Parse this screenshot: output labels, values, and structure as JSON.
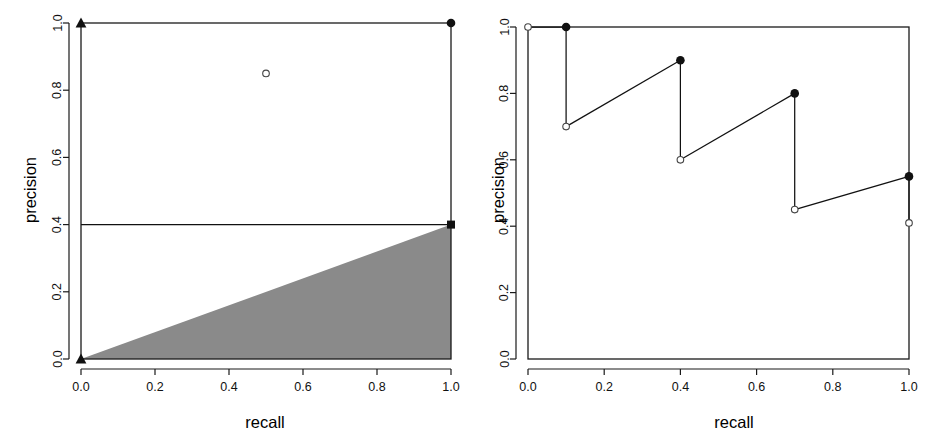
{
  "figure": {
    "background": "#ffffff",
    "ink_color": "#111111",
    "panel_count": 2
  },
  "chart_data": [
    {
      "panel": "left",
      "type": "scatter",
      "title": "",
      "xlabel": "recall",
      "ylabel": "precision",
      "xlim": [
        0.0,
        1.0
      ],
      "ylim": [
        0.0,
        1.0
      ],
      "xticks": [
        "0.0",
        "0.2",
        "0.4",
        "0.6",
        "0.8",
        "1.0"
      ],
      "xtickvalues": [
        0.0,
        0.2,
        0.4,
        0.6,
        0.8,
        1.0
      ],
      "yticks": [
        "0.0",
        "0.2",
        "0.4",
        "0.6",
        "0.8",
        "1.0"
      ],
      "ytickvalues": [
        0.0,
        0.2,
        0.4,
        0.6,
        0.8,
        1.0
      ],
      "grid": false,
      "legend": "none",
      "series": [
        {
          "name": "corner-markers-triangle",
          "marker": "filled-triangle",
          "points": [
            {
              "x": 0.0,
              "y": 1.0
            },
            {
              "x": 0.0,
              "y": 0.0
            }
          ]
        },
        {
          "name": "corner-marker-circle",
          "marker": "filled-circle",
          "points": [
            {
              "x": 1.0,
              "y": 1.0
            }
          ]
        },
        {
          "name": "interior-point",
          "marker": "open-circle",
          "points": [
            {
              "x": 0.5,
              "y": 0.85
            }
          ]
        },
        {
          "name": "baseline-endpoint",
          "marker": "filled-square",
          "points": [
            {
              "x": 1.0,
              "y": 0.4
            }
          ]
        }
      ],
      "lines": [
        {
          "name": "baseline-precision",
          "style": "solid",
          "points": [
            {
              "x": 0.0,
              "y": 0.4
            },
            {
              "x": 1.0,
              "y": 0.4
            }
          ]
        }
      ],
      "regions": [
        {
          "name": "achievable-region-triangle",
          "fill": "#8a8a8a",
          "vertices": [
            {
              "x": 0.0,
              "y": 0.0
            },
            {
              "x": 1.0,
              "y": 0.4
            },
            {
              "x": 1.0,
              "y": 0.0
            }
          ]
        }
      ]
    },
    {
      "panel": "right",
      "type": "line",
      "title": "",
      "xlabel": "recall",
      "ylabel": "precision",
      "xlim": [
        0.0,
        1.0
      ],
      "ylim": [
        0.0,
        1.0
      ],
      "xticks": [
        "0.0",
        "0.2",
        "0.4",
        "0.6",
        "0.8",
        "1.0"
      ],
      "xtickvalues": [
        0.0,
        0.2,
        0.4,
        0.6,
        0.8,
        1.0
      ],
      "yticks": [
        "0.0",
        "0.2",
        "0.4",
        "0.6",
        "0.8",
        "1.0"
      ],
      "ytickvalues": [
        0.0,
        0.2,
        0.4,
        0.6,
        0.8,
        1.0
      ],
      "grid": false,
      "legend": "none",
      "staircase": {
        "name": "precision-recall-sawtooth",
        "segments": [
          {
            "from": {
              "x": 0.0,
              "y": 1.0
            },
            "to": {
              "x": 0.1,
              "y": 1.0
            },
            "kind": "horizontal"
          },
          {
            "from": {
              "x": 0.1,
              "y": 1.0
            },
            "to": {
              "x": 0.1,
              "y": 0.7
            },
            "kind": "vertical-drop"
          },
          {
            "from": {
              "x": 0.1,
              "y": 0.7
            },
            "to": {
              "x": 0.4,
              "y": 0.9
            },
            "kind": "rising"
          },
          {
            "from": {
              "x": 0.4,
              "y": 0.9
            },
            "to": {
              "x": 0.4,
              "y": 0.6
            },
            "kind": "vertical-drop"
          },
          {
            "from": {
              "x": 0.4,
              "y": 0.6
            },
            "to": {
              "x": 0.7,
              "y": 0.8
            },
            "kind": "rising"
          },
          {
            "from": {
              "x": 0.7,
              "y": 0.8
            },
            "to": {
              "x": 0.7,
              "y": 0.45
            },
            "kind": "vertical-drop"
          },
          {
            "from": {
              "x": 0.7,
              "y": 0.45
            },
            "to": {
              "x": 1.0,
              "y": 0.55
            },
            "kind": "rising"
          },
          {
            "from": {
              "x": 1.0,
              "y": 0.55
            },
            "to": {
              "x": 1.0,
              "y": 0.41
            },
            "kind": "vertical-drop"
          }
        ]
      },
      "series": [
        {
          "name": "segment-end-points",
          "marker": "filled-circle",
          "points": [
            {
              "x": 0.1,
              "y": 1.0
            },
            {
              "x": 0.4,
              "y": 0.9
            },
            {
              "x": 0.7,
              "y": 0.8
            },
            {
              "x": 1.0,
              "y": 0.55
            }
          ]
        },
        {
          "name": "segment-start-points",
          "marker": "open-circle",
          "points": [
            {
              "x": 0.0,
              "y": 1.0
            },
            {
              "x": 0.1,
              "y": 0.7
            },
            {
              "x": 0.4,
              "y": 0.6
            },
            {
              "x": 0.7,
              "y": 0.45
            },
            {
              "x": 1.0,
              "y": 0.41
            }
          ]
        }
      ]
    }
  ]
}
